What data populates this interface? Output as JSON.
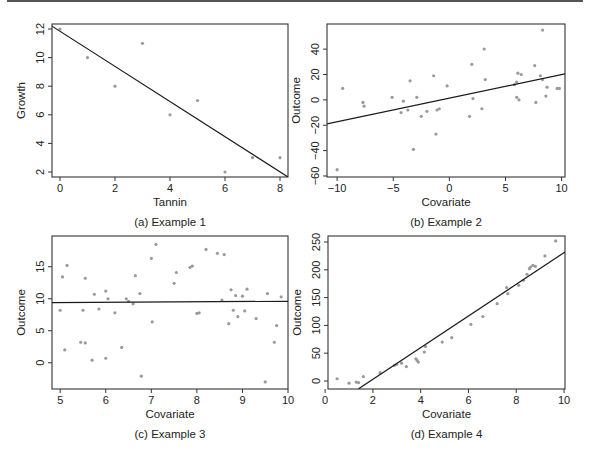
{
  "figure": {
    "top_rule": true,
    "panels": [
      {
        "id": "a",
        "caption": "(a) Example 1"
      },
      {
        "id": "b",
        "caption": "(b) Example 2"
      },
      {
        "id": "c",
        "caption": "(c) Example 3"
      },
      {
        "id": "d",
        "caption": "(d) Example 4"
      }
    ]
  },
  "colors": {
    "axis": "#333333",
    "points": "#9a9a9a",
    "fit_line": "#1a1a1a",
    "text": "#222222"
  },
  "chart_data": [
    {
      "type": "scatter",
      "title": "",
      "caption": "(a) Example 1",
      "xlabel": "Tannin",
      "ylabel": "Growth",
      "xlim": [
        -0.29,
        8.29
      ],
      "ylim": [
        1.65,
        12.35
      ],
      "xticks": [
        0,
        2,
        4,
        6,
        8
      ],
      "yticks": [
        2,
        4,
        6,
        8,
        10,
        12
      ],
      "grid": false,
      "legend": null,
      "points": {
        "x": [
          0,
          1,
          2,
          3,
          4,
          5,
          6,
          7,
          8
        ],
        "y": [
          12,
          10,
          8,
          11,
          6,
          7,
          2,
          3,
          3
        ]
      },
      "fit_line": {
        "x": [
          -0.29,
          8.29
        ],
        "y": [
          12.2,
          1.65
        ]
      }
    },
    {
      "type": "scatter",
      "title": "",
      "caption": "(b) Example 2",
      "xlabel": "Covariate",
      "ylabel": "Outcome",
      "xlim": [
        -10.9,
        10.3
      ],
      "ylim": [
        -60.8,
        59.8
      ],
      "xticks": [
        -10,
        -5,
        0,
        5,
        10
      ],
      "yticks": [
        -60,
        -40,
        -20,
        0,
        20,
        40
      ],
      "grid": false,
      "legend": null,
      "points": {
        "x": [
          -10,
          -9.5,
          -7.7,
          -7.6,
          -5.1,
          -4.3,
          -4.1,
          -3.7,
          -3.5,
          -3.2,
          -2.9,
          -2.5,
          -2,
          -1.4,
          -1.2,
          -1.1,
          -0.9,
          -0.2,
          1.8,
          2,
          2.1,
          2.9,
          3.1,
          3.2,
          5.8,
          6,
          6,
          6.1,
          6.2,
          6.4,
          7.6,
          7.7,
          8.1,
          8.3,
          8.3,
          8.6,
          8.7,
          9.6,
          9.8
        ],
        "y": [
          -55,
          9,
          -2,
          -5,
          2,
          -10,
          -1,
          -8,
          15,
          -39,
          2,
          -13,
          -9,
          19,
          -27,
          -8,
          -7,
          11,
          -13,
          28,
          1,
          -7,
          40,
          16,
          12,
          2,
          14,
          21,
          0,
          20,
          27,
          -2,
          19,
          55,
          16,
          3,
          10,
          9,
          9
        ]
      },
      "fit_line": {
        "x": [
          -10.9,
          10.3
        ],
        "y": [
          -19,
          20.5
        ]
      }
    },
    {
      "type": "scatter",
      "title": "",
      "caption": "(c) Example 3",
      "xlabel": "Covariate",
      "ylabel": "Outcome",
      "xlim": [
        4.82,
        10.0
      ],
      "ylim": [
        -4.1,
        19.8
      ],
      "xticks": [
        5,
        6,
        7,
        8,
        9,
        10
      ],
      "yticks": [
        0,
        5,
        10,
        15
      ],
      "grid": false,
      "legend": null,
      "points": {
        "x": [
          5.0,
          5.05,
          5.1,
          5.15,
          5.45,
          5.5,
          5.55,
          5.55,
          5.7,
          5.75,
          5.85,
          6.0,
          6.0,
          6.05,
          6.2,
          6.35,
          6.45,
          6.5,
          6.6,
          6.65,
          6.75,
          6.78,
          7.0,
          7.02,
          7.1,
          7.5,
          7.55,
          7.85,
          7.9,
          8.0,
          8.05,
          8.2,
          8.45,
          8.55,
          8.6,
          8.7,
          8.75,
          8.8,
          8.85,
          8.9,
          9.0,
          9.05,
          9.1,
          9.3,
          9.5,
          9.55,
          9.7,
          9.75,
          9.85
        ],
        "y": [
          8.2,
          13.4,
          2,
          15.2,
          3.2,
          8.2,
          13.2,
          3.1,
          0.4,
          10.7,
          8.4,
          0.7,
          11.2,
          10,
          7.8,
          2.4,
          10,
          9.6,
          9.2,
          13.6,
          10.8,
          -2.1,
          16.3,
          6.4,
          18.5,
          12.4,
          14.1,
          14.9,
          15.1,
          7.7,
          7.8,
          17.7,
          17.1,
          9.8,
          16.9,
          6.1,
          11.4,
          8.2,
          10.5,
          7.2,
          10.4,
          8.1,
          11.5,
          6.9,
          -3,
          10.8,
          3.2,
          5.8,
          10.3
        ]
      },
      "fit_line": {
        "x": [
          4.82,
          10.0
        ],
        "y": [
          9.4,
          9.6
        ]
      }
    },
    {
      "type": "scatter",
      "title": "",
      "caption": "(d) Example 4",
      "xlabel": "Covariate",
      "ylabel": "Outcome",
      "xlim": [
        0.12,
        10.04
      ],
      "ylim": [
        -14.4,
        260.8
      ],
      "xticks": [
        0,
        2,
        4,
        6,
        8,
        10
      ],
      "yticks": [
        0,
        50,
        100,
        150,
        200,
        250
      ],
      "grid": false,
      "legend": null,
      "points": {
        "x": [
          0.5,
          1.0,
          1.3,
          1.4,
          1.6,
          2.3,
          2.9,
          3.0,
          3.2,
          3.4,
          3.8,
          3.85,
          3.9,
          4.15,
          4.2,
          4.9,
          5.3,
          6.1,
          6.6,
          7.2,
          7.6,
          7.65,
          8.1,
          8.3,
          8.45,
          8.55,
          8.6,
          8.7,
          8.8,
          9.2,
          9.65
        ],
        "y": [
          4,
          -4,
          -2,
          -3,
          8,
          15,
          28,
          30,
          32,
          26,
          40,
          37,
          34,
          52,
          62,
          70,
          78,
          102,
          116,
          139,
          168,
          157,
          172,
          181,
          192,
          202,
          205,
          208,
          206,
          225,
          252
        ]
      },
      "fit_line": {
        "x": [
          1.4,
          10.04
        ],
        "y": [
          -14,
          232
        ]
      }
    }
  ]
}
